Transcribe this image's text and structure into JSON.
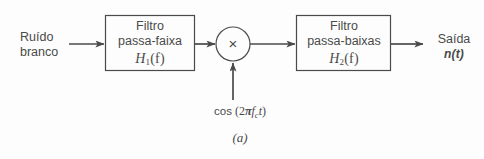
{
  "figure": {
    "caption": "(a)",
    "background_color": "#fdfdfd",
    "stroke_color": "#4a4a4a"
  },
  "input": {
    "line1": "Ruído",
    "line2": "branco"
  },
  "output": {
    "line1": "Saída",
    "line2": "n(t)"
  },
  "blocks": [
    {
      "id": "bandpass-filter",
      "line1": "Filtro",
      "line2": "passa-faixa",
      "transfer_function": "H",
      "tf_subscript": "1",
      "tf_arg": "(f)"
    },
    {
      "id": "lowpass-filter",
      "line1": "Filtro",
      "line2": "passa-baixas",
      "transfer_function": "H",
      "tf_subscript": "2",
      "tf_arg": "(f)"
    }
  ],
  "multiplier": {
    "symbol": "×",
    "name": "multiplier"
  },
  "oscillator": {
    "fn": "cos",
    "open_paren": " (",
    "coefficient": "2",
    "pi": "π",
    "frequency": "f",
    "frequency_sub": "c",
    "time": "t",
    "close_paren": ")",
    "full_text": "cos (2πfct)"
  }
}
